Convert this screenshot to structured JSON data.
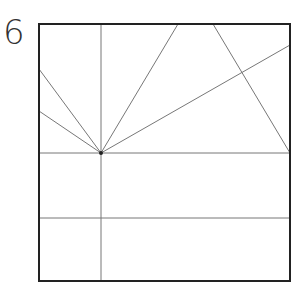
{
  "step": {
    "number": "6"
  },
  "diagram": {
    "type": "origami crease pattern",
    "square": {
      "x1": 39,
      "y1": 24,
      "x2": 290,
      "y2": 281
    },
    "hub_point": {
      "x": 101,
      "y": 153
    },
    "colors": {
      "border": "#222222",
      "crease": "#777777"
    },
    "lines": [
      {
        "name": "vertical-crease",
        "x1": 101,
        "y1": 24,
        "x2": 101,
        "y2": 281
      },
      {
        "name": "upper-horizontal-crease",
        "x1": 39,
        "y1": 153,
        "x2": 290,
        "y2": 153
      },
      {
        "name": "lower-horizontal-crease",
        "x1": 39,
        "y1": 218,
        "x2": 290,
        "y2": 218
      },
      {
        "name": "ray-left-upper",
        "x1": 101,
        "y1": 153,
        "x2": 39,
        "y2": 69
      },
      {
        "name": "ray-left-lower",
        "x1": 101,
        "y1": 153,
        "x2": 39,
        "y2": 111
      },
      {
        "name": "ray-top",
        "x1": 101,
        "y1": 153,
        "x2": 178,
        "y2": 24
      },
      {
        "name": "ray-right",
        "x1": 101,
        "y1": 153,
        "x2": 290,
        "y2": 45
      },
      {
        "name": "diagonal-top-to-right",
        "x1": 213,
        "y1": 24,
        "x2": 290,
        "y2": 153
      }
    ]
  }
}
